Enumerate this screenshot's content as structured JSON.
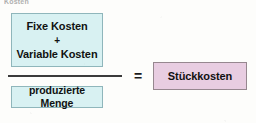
{
  "diagram": {
    "title_fragment": "Kosten",
    "type": "formula",
    "fraction": {
      "numerator": {
        "lines": [
          "Fixe Kosten",
          "+",
          "Variable Kosten"
        ],
        "fill_color": "#d8f1f2",
        "border_color": "#8fb6bb"
      },
      "denominator": {
        "label": "produzierte Menge",
        "fill_color": "#d8f1f2",
        "border_color": "#8fb6bb"
      },
      "bar_color": "#3b3b3b"
    },
    "operator": "=",
    "result": {
      "label": "Stückkosten",
      "fill_color": "#e8cde1",
      "border_color": "#96878f"
    },
    "background_color": "#fdfdfb"
  }
}
